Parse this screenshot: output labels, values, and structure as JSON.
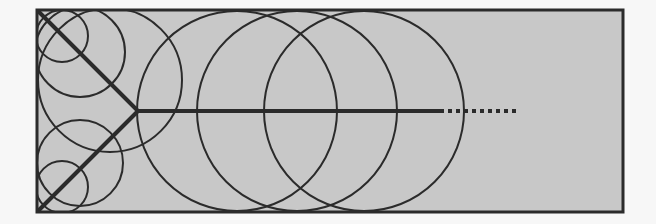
{
  "diagram": {
    "background": "#f7f7f7",
    "panel_fill": "#c8c8c8",
    "stroke": "#2b2b2b",
    "frame": {
      "x": 37,
      "y": 10,
      "w": 586,
      "h": 202
    },
    "junction": {
      "x": 138,
      "y": 111
    },
    "branches": [
      {
        "x1": 39,
        "y1": 12,
        "x2": 138,
        "y2": 111
      },
      {
        "x1": 39,
        "y1": 210,
        "x2": 138,
        "y2": 111
      }
    ],
    "trunk": {
      "x1": 138,
      "y1": 111,
      "x2": 440,
      "y2": 111
    },
    "trunk_dotted": {
      "x1": 440,
      "y1": 111,
      "x2": 516,
      "y2": 111
    },
    "circles": [
      {
        "cx": 62,
        "cy": 36,
        "r": 26
      },
      {
        "cx": 80,
        "cy": 52,
        "r": 45
      },
      {
        "cx": 110,
        "cy": 80,
        "r": 72
      },
      {
        "cx": 62,
        "cy": 187,
        "r": 26
      },
      {
        "cx": 80,
        "cy": 163,
        "r": 43
      },
      {
        "cx": 237,
        "cy": 111,
        "r": 100
      },
      {
        "cx": 297,
        "cy": 111,
        "r": 100
      },
      {
        "cx": 364,
        "cy": 111,
        "r": 100
      }
    ]
  }
}
